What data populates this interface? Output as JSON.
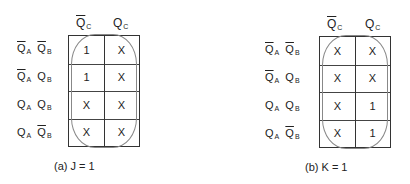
{
  "maps": [
    {
      "id": "a",
      "caption": "(a) J = 1",
      "col_headers": [
        {
          "var": "Q",
          "sub": "C",
          "negated": true
        },
        {
          "var": "Q",
          "sub": "C",
          "negated": false
        }
      ],
      "row_headers": [
        [
          {
            "var": "Q",
            "sub": "A",
            "negated": true
          },
          {
            "var": "Q",
            "sub": "B",
            "negated": true
          }
        ],
        [
          {
            "var": "Q",
            "sub": "A",
            "negated": true
          },
          {
            "var": "Q",
            "sub": "B",
            "negated": false
          }
        ],
        [
          {
            "var": "Q",
            "sub": "A",
            "negated": false
          },
          {
            "var": "Q",
            "sub": "B",
            "negated": false
          }
        ],
        [
          {
            "var": "Q",
            "sub": "A",
            "negated": false
          },
          {
            "var": "Q",
            "sub": "B",
            "negated": true
          }
        ]
      ],
      "cells": [
        [
          "1",
          "X"
        ],
        [
          "1",
          "X"
        ],
        [
          "X",
          "X"
        ],
        [
          "X",
          "X"
        ]
      ],
      "grouping": "all 8 cells"
    },
    {
      "id": "b",
      "caption": "(b) K = 1",
      "col_headers": [
        {
          "var": "Q",
          "sub": "C",
          "negated": true
        },
        {
          "var": "Q",
          "sub": "C",
          "negated": false
        }
      ],
      "row_headers": [
        [
          {
            "var": "Q",
            "sub": "A",
            "negated": true
          },
          {
            "var": "Q",
            "sub": "B",
            "negated": true
          }
        ],
        [
          {
            "var": "Q",
            "sub": "A",
            "negated": true
          },
          {
            "var": "Q",
            "sub": "B",
            "negated": false
          }
        ],
        [
          {
            "var": "Q",
            "sub": "A",
            "negated": false
          },
          {
            "var": "Q",
            "sub": "B",
            "negated": false
          }
        ],
        [
          {
            "var": "Q",
            "sub": "A",
            "negated": false
          },
          {
            "var": "Q",
            "sub": "B",
            "negated": true
          }
        ]
      ],
      "cells": [
        [
          "X",
          "X"
        ],
        [
          "X",
          "X"
        ],
        [
          "X",
          "1"
        ],
        [
          "X",
          "1"
        ]
      ],
      "grouping": "all 8 cells"
    }
  ]
}
